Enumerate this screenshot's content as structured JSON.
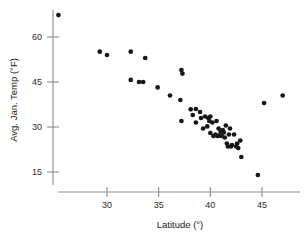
{
  "chart_data": {
    "type": "scatter",
    "title": "",
    "xlabel": "Latitude (°)",
    "ylabel": "Avg. Jan. Temp (°F)",
    "xlim": [
      24.5,
      48.0
    ],
    "ylim": [
      12.0,
      69.0
    ],
    "xticks": [
      30,
      35,
      40,
      45
    ],
    "yticks": [
      15,
      30,
      45,
      60
    ],
    "xticklabels": [
      "30",
      "35",
      "40",
      "45"
    ],
    "yticklabels": [
      "15",
      "30",
      "45",
      "60"
    ],
    "grid": false,
    "legend": null,
    "marker": "filled-circle",
    "marker_color": "#171717",
    "axis_color": "#8c8c8c",
    "points": [
      {
        "x": 25.3,
        "y": 67.3
      },
      {
        "x": 29.3,
        "y": 55.1
      },
      {
        "x": 30.0,
        "y": 54.0
      },
      {
        "x": 32.3,
        "y": 55.1
      },
      {
        "x": 33.7,
        "y": 53.0
      },
      {
        "x": 32.3,
        "y": 45.7
      },
      {
        "x": 33.1,
        "y": 45.0
      },
      {
        "x": 33.5,
        "y": 45.0
      },
      {
        "x": 34.9,
        "y": 43.2
      },
      {
        "x": 36.1,
        "y": 40.5
      },
      {
        "x": 37.2,
        "y": 49.0
      },
      {
        "x": 37.3,
        "y": 47.8
      },
      {
        "x": 37.1,
        "y": 39.0
      },
      {
        "x": 37.2,
        "y": 32.0
      },
      {
        "x": 38.1,
        "y": 35.9
      },
      {
        "x": 38.3,
        "y": 34.0
      },
      {
        "x": 38.6,
        "y": 36.0
      },
      {
        "x": 38.6,
        "y": 31.5
      },
      {
        "x": 39.0,
        "y": 35.0
      },
      {
        "x": 39.1,
        "y": 33.0
      },
      {
        "x": 39.3,
        "y": 29.5
      },
      {
        "x": 39.5,
        "y": 33.5
      },
      {
        "x": 39.7,
        "y": 30.2
      },
      {
        "x": 39.8,
        "y": 33.0
      },
      {
        "x": 39.9,
        "y": 32.0
      },
      {
        "x": 40.0,
        "y": 33.5
      },
      {
        "x": 40.0,
        "y": 28.0
      },
      {
        "x": 40.2,
        "y": 31.5
      },
      {
        "x": 40.3,
        "y": 27.0
      },
      {
        "x": 40.5,
        "y": 27.5
      },
      {
        "x": 40.6,
        "y": 32.0
      },
      {
        "x": 40.7,
        "y": 27.0
      },
      {
        "x": 40.8,
        "y": 29.5
      },
      {
        "x": 40.9,
        "y": 27.2
      },
      {
        "x": 41.0,
        "y": 28.5
      },
      {
        "x": 41.1,
        "y": 27.0
      },
      {
        "x": 41.2,
        "y": 29.0
      },
      {
        "x": 41.3,
        "y": 28.2
      },
      {
        "x": 41.4,
        "y": 26.5
      },
      {
        "x": 41.5,
        "y": 30.5
      },
      {
        "x": 41.6,
        "y": 24.5
      },
      {
        "x": 41.7,
        "y": 23.5
      },
      {
        "x": 41.8,
        "y": 27.5
      },
      {
        "x": 41.9,
        "y": 29.5
      },
      {
        "x": 42.0,
        "y": 23.5
      },
      {
        "x": 42.1,
        "y": 24.0
      },
      {
        "x": 42.3,
        "y": 27.5
      },
      {
        "x": 42.5,
        "y": 23.5
      },
      {
        "x": 42.6,
        "y": 24.5
      },
      {
        "x": 42.7,
        "y": 23.0
      },
      {
        "x": 42.9,
        "y": 25.5
      },
      {
        "x": 43.0,
        "y": 20.0
      },
      {
        "x": 44.6,
        "y": 14.0
      },
      {
        "x": 45.2,
        "y": 38.0
      },
      {
        "x": 47.0,
        "y": 40.5
      }
    ]
  }
}
